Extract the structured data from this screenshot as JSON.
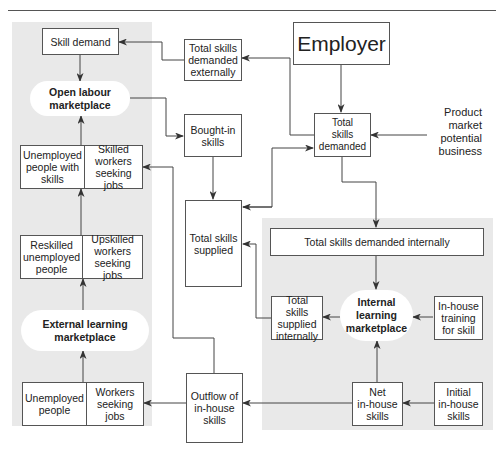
{
  "diagram": {
    "nodes": {
      "skill_demand": "Skill demand",
      "open_labour_marketplace": "Open labour\nmarketplace",
      "total_skills_demanded_externally": "Total skills\ndemanded\nexternally",
      "employer": "Employer",
      "total_skills_demanded": "Total\nskills\ndemanded",
      "product_market": "Product\nmarket\npotential\nbusiness",
      "bought_in_skills": "Bought-in\nskills",
      "unemployed_with_skills": "Unemployed\npeople with\nskills",
      "skilled_workers_seeking_jobs": "Skilled\nworkers\nseeking jobs",
      "total_skills_supplied": "Total skills\nsupplied",
      "total_skills_demanded_internally": "Total skills demanded internally",
      "reskilled_unemployed": "Reskilled\nunemployed\npeople",
      "upskilled_workers_seeking_jobs": "Upskilled\nworkers\nseeking jobs",
      "total_skills_supplied_internally": "Total skills\nsupplied\ninternally",
      "internal_learning_marketplace": "Internal\nlearning\nmarketplace",
      "in_house_training": "In-house\ntraining\nfor skill",
      "external_learning_marketplace": "External learning\nmarketplace",
      "unemployed_people": "Unemployed\npeople",
      "workers_seeking_jobs": "Workers\nseeking jobs",
      "outflow_in_house_skills": "Outflow of\nin-house\nskills",
      "net_in_house_skills": "Net\nin-house\nskills",
      "initial_in_house_skills": "Initial\nin-house\nskills"
    },
    "edges": [
      [
        "employer",
        "total_skills_demanded"
      ],
      [
        "product_market",
        "total_skills_demanded"
      ],
      [
        "total_skills_demanded",
        "total_skills_demanded_externally"
      ],
      [
        "total_skills_demanded_externally",
        "skill_demand"
      ],
      [
        "skill_demand",
        "open_labour_marketplace"
      ],
      [
        "open_labour_marketplace",
        "bought_in_skills"
      ],
      [
        "bought_in_skills",
        "total_skills_supplied"
      ],
      [
        "total_skills_supplied",
        "total_skills_demanded"
      ],
      [
        "total_skills_demanded",
        "total_skills_supplied"
      ],
      [
        "total_skills_demanded",
        "total_skills_demanded_internally"
      ],
      [
        "total_skills_demanded_internally",
        "internal_learning_marketplace"
      ],
      [
        "in_house_training",
        "internal_learning_marketplace"
      ],
      [
        "internal_learning_marketplace",
        "total_skills_supplied_internally"
      ],
      [
        "total_skills_supplied_internally",
        "total_skills_supplied"
      ],
      [
        "net_in_house_skills",
        "internal_learning_marketplace"
      ],
      [
        "initial_in_house_skills",
        "net_in_house_skills"
      ],
      [
        "net_in_house_skills",
        "outflow_in_house_skills"
      ],
      [
        "outflow_in_house_skills",
        "workers_seeking_jobs"
      ],
      [
        "outflow_in_house_skills",
        "skilled_workers_seeking_jobs"
      ],
      [
        "workers_seeking_jobs",
        "external_learning_marketplace"
      ],
      [
        "external_learning_marketplace",
        "upskilled_workers_seeking_jobs"
      ],
      [
        "upskilled_workers_seeking_jobs",
        "skilled_workers_seeking_jobs"
      ],
      [
        "skilled_workers_seeking_jobs",
        "open_labour_marketplace"
      ]
    ],
    "colors": {
      "panel": "#e9e9e9",
      "line": "#444444",
      "box_fill": "#ffffff"
    }
  }
}
